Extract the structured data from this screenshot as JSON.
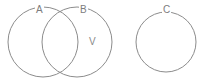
{
  "figure": {
    "name": "venn-diagram",
    "background_color": "#ffffff",
    "stroke_color": "#8c8c8c",
    "label_color": "#7d7d7d",
    "width": 203,
    "height": 83
  },
  "sets": [
    {
      "id": "A",
      "label": "A",
      "cx": 43,
      "cy": 42,
      "r": 35,
      "label_x": 35,
      "label_y": 5
    },
    {
      "id": "B",
      "label": "B",
      "cx": 77,
      "cy": 42,
      "r": 35,
      "label_x": 79,
      "label_y": 5
    },
    {
      "id": "C",
      "label": "C",
      "cx": 166,
      "cy": 42,
      "r": 30,
      "label_x": 162,
      "label_y": 5
    }
  ],
  "regions": [
    {
      "id": "V",
      "label": "V",
      "x": 89,
      "y": 37,
      "belongs_to": "B"
    }
  ]
}
